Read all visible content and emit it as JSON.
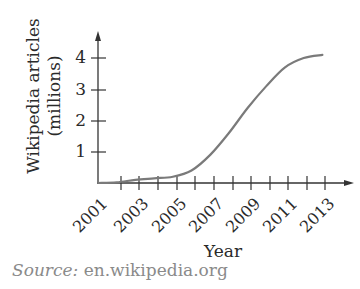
{
  "chart_data": {
    "type": "line",
    "title": "",
    "xlabel": "Year",
    "ylabel": "Wikipedia articles (millions)",
    "ylabel_lines": [
      "Wikipedia articles",
      "(millions)"
    ],
    "x_ticks": [
      "2001",
      "2003",
      "2005",
      "2007",
      "2009",
      "2011",
      "2013"
    ],
    "y_ticks": [
      "1",
      "2",
      "3",
      "4"
    ],
    "ylim": [
      0,
      4.5
    ],
    "xlim": [
      2001,
      2014
    ],
    "grid": false,
    "legend": null,
    "series": [
      {
        "name": "Wikipedia articles",
        "x": [
          2001,
          2002,
          2003,
          2004,
          2005,
          2006,
          2007,
          2008,
          2009,
          2010,
          2011,
          2012,
          2013
        ],
        "values": [
          0.0,
          0.02,
          0.1,
          0.15,
          0.2,
          0.4,
          0.9,
          1.6,
          2.4,
          3.1,
          3.7,
          4.0,
          4.1
        ]
      }
    ],
    "source": "en.wikipedia.org"
  },
  "labels": {
    "ylabel_line1": "Wikipedia articles",
    "ylabel_line2": "(millions)",
    "xlabel": "Year",
    "source_prefix": "Source:",
    "source_text": " en.wikipedia.org",
    "yticks": [
      "1",
      "2",
      "3",
      "4"
    ],
    "xticks": [
      "2001",
      "2003",
      "2005",
      "2007",
      "2009",
      "2011",
      "2013"
    ]
  },
  "colors": {
    "axis": "#333333",
    "curve": "#7a7a7a",
    "source_text": "#8a8a8a"
  }
}
